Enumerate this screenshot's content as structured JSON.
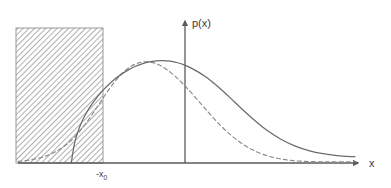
{
  "figure": {
    "title": "",
    "background_color": "#ffffff",
    "width": 391,
    "height": 188
  },
  "axes": {
    "y_axis_label": "p(x)",
    "x_axis_label": "x",
    "axis_color": "#5a5a5a",
    "origin_x": 185,
    "baseline_y": 163,
    "x_start": 18,
    "x_end": 362,
    "y_top": 17
  },
  "ticks": [
    {
      "name": "minus-x0",
      "text": "-x",
      "subscript": "0",
      "x": 103
    }
  ],
  "shaded_region": {
    "label": "hatched-region",
    "hatch_angle_deg": 45,
    "hatch_color": "#9a9a9a",
    "border_color": "#8f8f8f",
    "x": 16,
    "y": 28,
    "width": 87,
    "height": 135
  },
  "chart_data": {
    "type": "line",
    "title": "",
    "xlabel": "x",
    "ylabel": "p(x)",
    "grid": false,
    "legend_position": "none",
    "xlim": [
      -3.5,
      6.2
    ],
    "ylim": [
      0,
      1.12
    ],
    "annotations": [
      {
        "text": "-x0",
        "x": -2.0,
        "y": 0,
        "description": "cut-off point where the solid truncated density starts"
      },
      {
        "text": "hatched area",
        "x": -3.1,
        "y": 0.5,
        "description": "shaded rectangle covering the region x < -x0 removed by truncation"
      }
    ],
    "series": [
      {
        "name": "truncated-renormalized-density",
        "style": "solid",
        "color": "#6b6b6b",
        "x": [
          -2.0,
          -1.9,
          -1.8,
          -1.7,
          -1.6,
          -1.5,
          -1.4,
          -1.3,
          -1.2,
          -1.1,
          -1.0,
          -0.8,
          -0.6,
          -0.4,
          -0.2,
          0.0,
          0.2,
          0.4,
          0.6,
          0.8,
          1.0,
          1.2,
          1.4,
          1.6,
          1.8,
          2.0,
          2.3,
          2.6,
          2.9,
          3.2,
          3.5,
          3.9,
          4.3,
          4.7,
          5.1,
          5.5,
          6.0
        ],
        "y": [
          0.0,
          0.19,
          0.3,
          0.382,
          0.447,
          0.503,
          0.552,
          0.596,
          0.637,
          0.674,
          0.708,
          0.768,
          0.818,
          0.86,
          0.893,
          0.918,
          0.936,
          0.946,
          0.948,
          0.942,
          0.928,
          0.906,
          0.876,
          0.839,
          0.795,
          0.745,
          0.66,
          0.567,
          0.474,
          0.386,
          0.307,
          0.222,
          0.159,
          0.115,
          0.086,
          0.069,
          0.058
        ]
      },
      {
        "name": "original-untruncated-density",
        "style": "dashed",
        "color": "#8a8a8a",
        "x": [
          -3.5,
          -3.3,
          -3.1,
          -2.9,
          -2.7,
          -2.5,
          -2.3,
          -2.1,
          -1.9,
          -1.7,
          -1.5,
          -1.3,
          -1.1,
          -0.9,
          -0.7,
          -0.5,
          -0.3,
          -0.1,
          0.1,
          0.3,
          0.5,
          0.7,
          0.9,
          1.1,
          1.3,
          1.6,
          1.9,
          2.2,
          2.5,
          2.8,
          3.1,
          3.4,
          3.8,
          4.2,
          4.6,
          5.0,
          5.4,
          6.0
        ],
        "y": [
          0.015,
          0.022,
          0.032,
          0.046,
          0.066,
          0.094,
          0.131,
          0.18,
          0.242,
          0.318,
          0.406,
          0.503,
          0.602,
          0.697,
          0.781,
          0.849,
          0.898,
          0.927,
          0.937,
          0.929,
          0.904,
          0.864,
          0.812,
          0.75,
          0.681,
          0.57,
          0.457,
          0.351,
          0.259,
          0.183,
          0.124,
          0.081,
          0.044,
          0.024,
          0.015,
          0.011,
          0.01,
          0.01
        ]
      }
    ]
  }
}
